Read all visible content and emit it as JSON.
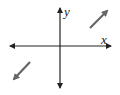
{
  "diagram": {
    "type": "coordinate-plane-with-vectors",
    "axes": {
      "x_label": "x",
      "y_label": "y",
      "color": "#222222"
    },
    "vectors": [
      {
        "name": "upper-right-arrow",
        "direction": "northeast",
        "quadrant": "I",
        "color": "#666666"
      },
      {
        "name": "lower-left-arrow",
        "direction": "southwest",
        "quadrant": "III",
        "color": "#666666"
      }
    ]
  }
}
